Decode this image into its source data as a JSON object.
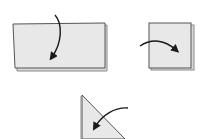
{
  "diagram": {
    "type": "origami-folding-steps",
    "colors": {
      "paper_fill": "#e6e6e6",
      "paper_edge": "#555555",
      "shadow_edge": "#8a8a8a",
      "arrow": "#1a1a1a",
      "background": "#ffffff"
    },
    "steps": [
      {
        "id": "step-1",
        "shape": "rectangle",
        "arrow": "fold-down-arrow"
      },
      {
        "id": "step-2",
        "shape": "square",
        "arrow": "fold-right-arrow"
      },
      {
        "id": "step-3",
        "shape": "triangle",
        "arrow": "fold-left-down-arrow"
      }
    ]
  }
}
